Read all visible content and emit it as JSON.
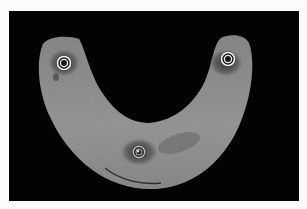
{
  "image": {
    "subject": "U-shaped gray implant bar with three embedded metal rings on black background",
    "colors": {
      "border": "#fbfbfb",
      "background": "#030303",
      "bar": "#8e8e8e",
      "bar_highlight": "#a6a6a6",
      "stain": "#3a3a3a",
      "ring": "#f2f2f2"
    },
    "implants": [
      {
        "name": "left",
        "cx": 55,
        "cy": 52
      },
      {
        "name": "right",
        "cx": 219,
        "cy": 48
      },
      {
        "name": "center",
        "cx": 130,
        "cy": 141
      }
    ]
  }
}
